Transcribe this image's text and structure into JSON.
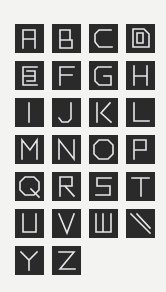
{
  "figure": {
    "background": "#f3f3f2",
    "tile_dark": "#2a2a2a",
    "stroke_light": "#f6f6f6"
  },
  "tiles": [
    {
      "letter": "A"
    },
    {
      "letter": "B"
    },
    {
      "letter": "C"
    },
    {
      "letter": "D"
    },
    {
      "letter": "E"
    },
    {
      "letter": "F"
    },
    {
      "letter": "G"
    },
    {
      "letter": "H"
    },
    {
      "letter": "I"
    },
    {
      "letter": "J"
    },
    {
      "letter": "K"
    },
    {
      "letter": "L"
    },
    {
      "letter": "M"
    },
    {
      "letter": "N"
    },
    {
      "letter": "O"
    },
    {
      "letter": "P"
    },
    {
      "letter": "Q"
    },
    {
      "letter": "R"
    },
    {
      "letter": "S"
    },
    {
      "letter": "T"
    },
    {
      "letter": "U"
    },
    {
      "letter": "V"
    },
    {
      "letter": "W"
    },
    {
      "letter": "X"
    },
    {
      "letter": "Y"
    },
    {
      "letter": "Z"
    }
  ]
}
